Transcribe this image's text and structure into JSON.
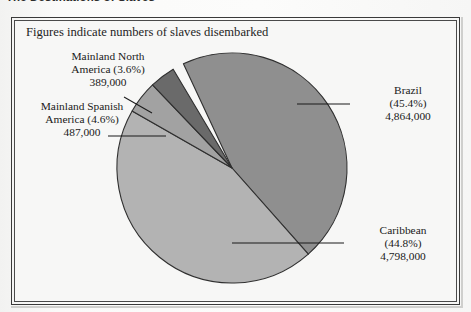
{
  "page": {
    "heading": "The Destinations of Slaves"
  },
  "figure": {
    "caption": "Figures indicate numbers of slaves disembarked",
    "frame_color": "#3a3a3a",
    "background_color": "#f7f7f6"
  },
  "chart_data": {
    "type": "pie",
    "title": "The Destinations of Slaves",
    "subtitle": "Figures indicate numbers of slaves disembarked",
    "xlabel": "",
    "ylabel": "",
    "units": "people disembarked",
    "total": 10538000,
    "legend": "none",
    "grid": false,
    "labels": [
      "Brazil",
      "Caribbean",
      "Mainland Spanish America",
      "Mainland North America"
    ],
    "values": [
      4864000,
      4798000,
      487000,
      389000
    ],
    "percentages": [
      45.4,
      44.8,
      4.6,
      3.6
    ],
    "value_text": [
      "4,864,000",
      "4,798,000",
      "487,000",
      "389,000"
    ],
    "percent_text": [
      "(45.4%)",
      "(44.8%)",
      "(4.6%)",
      "(3.6%)"
    ],
    "slice_colors": [
      "#8f8f8f",
      "#b3b3b3",
      "#a2a2a2",
      "#6a6a6a"
    ],
    "slice_order": [
      "Brazil",
      "Caribbean",
      "Mainland Spanish America",
      "Mainland North America"
    ],
    "start_angle_deg": -25,
    "direction": "clockwise"
  },
  "slices": [
    {
      "id": "brazil",
      "name": "Brazil",
      "percent": "(45.4%)",
      "value": "4,864,000",
      "color": "#8f8f8f"
    },
    {
      "id": "caribbean",
      "name": "Caribbean",
      "percent": "(44.8%)",
      "value": "4,798,000",
      "color": "#b3b3b3"
    },
    {
      "id": "mainland-spanish-america",
      "name": "Mainland Spanish",
      "name2": "America (4.6%)",
      "percent": "(4.6%)",
      "value": "487,000",
      "color": "#a2a2a2"
    },
    {
      "id": "mainland-north-america",
      "name": "Mainland North",
      "name2": "America (3.6%)",
      "percent": "(3.6%)",
      "value": "389,000",
      "color": "#6a6a6a"
    }
  ]
}
